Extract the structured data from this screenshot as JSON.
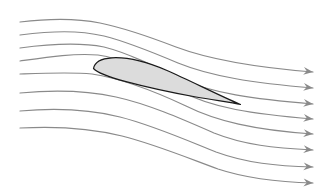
{
  "figure": {
    "width": 325,
    "height": 190,
    "background_color": "#ffffff"
  },
  "colors": {
    "background": "#ffffff",
    "streamline": "#8a8a8a",
    "arrowhead": "#8a8a8a",
    "airfoil_fill": "#dcdcdc",
    "airfoil_outline": "#1a1a1a"
  },
  "airfoil": {
    "name": "airfoil-cross-section",
    "fill": "#dcdcdc",
    "outline": "#1a1a1a",
    "outline_width": 1.2,
    "leading_edge": [
      93,
      67
    ],
    "trailing_edge": [
      240,
      104
    ],
    "chord_length": 150,
    "max_thickness": 24,
    "path": "M 93.5 68.5 C 94.5 62.5 101 58.5 112 57.8 C 126 57.0 146 61.5 167 70.5 C 190 80.5 218 95.0 240.5 104.5 C 232 102.5 214 100.2 196 97.0 C 172 92.6 146 87.0 126 81.6 C 108 76.8 97.5 73.0 93.5 68.5 Z"
  },
  "streamlines": {
    "count": 8,
    "stroke": "#8a8a8a",
    "stroke_width": 1.2,
    "start_x": 20,
    "end_x": 313,
    "arrow_size": 5,
    "paths": [
      {
        "id": "streamline-1",
        "label": "upper outer streamline",
        "start_y": 22,
        "end_y": 72,
        "d": "M 20 22 C 52 18 76 18 100 23 C 124 28 150 37 176 47 C 208 59 250 67 313 72"
      },
      {
        "id": "streamline-2",
        "label": "upper streamline 2",
        "start_y": 35,
        "end_y": 88,
        "d": "M 20 35 C 52 31 78 30 104 36 C 128 42 152 52 178 63 C 210 76 252 83 313 88"
      },
      {
        "id": "streamline-3",
        "label": "upper streamline 3",
        "start_y": 48,
        "end_y": 104,
        "d": "M 20 48 C 50 44 78 42 104 47 C 128 53 154 66 180 79 C 212 93 252 99 313 104"
      },
      {
        "id": "streamline-4",
        "label": "upper streamline 4 near suction surface",
        "start_y": 61,
        "end_y": 119,
        "d": "M 20 61 C 48 57 74 53 98 55 C 122 58 150 73 180 91 C 212 108 252 114 313 119"
      },
      {
        "id": "streamline-5",
        "label": "stagnation streamline along lower surface",
        "start_y": 74,
        "end_y": 134,
        "d": "M 20 74 C 48 73 72 72 92 74 C 118 78 152 90 186 106 C 216 121 254 130 313 134"
      },
      {
        "id": "streamline-6",
        "label": "lower streamline 6",
        "start_y": 93,
        "end_y": 150,
        "d": "M 20 93 C 52 90 84 90 116 97 C 148 104 182 119 214 133 C 244 145 274 148 313 150"
      },
      {
        "id": "streamline-7",
        "label": "lower streamline 7",
        "start_y": 111,
        "end_y": 167,
        "d": "M 20 111 C 54 108 88 109 120 117 C 152 125 186 140 216 152 C 246 163 276 166 313 167"
      },
      {
        "id": "streamline-8",
        "label": "lower outer streamline",
        "start_y": 128,
        "end_y": 183,
        "d": "M 20 128 C 56 126 90 128 122 136 C 154 144 188 158 218 169 C 248 179 278 182 313 183"
      }
    ],
    "arrowheads": [
      {
        "id": "arrowhead-1",
        "x": 313,
        "y": 72,
        "angle": 7
      },
      {
        "id": "arrowhead-2",
        "x": 313,
        "y": 88,
        "angle": 7
      },
      {
        "id": "arrowhead-3",
        "x": 313,
        "y": 104,
        "angle": 7
      },
      {
        "id": "arrowhead-4",
        "x": 313,
        "y": 119,
        "angle": 7
      },
      {
        "id": "arrowhead-5",
        "x": 313,
        "y": 134,
        "angle": 6
      },
      {
        "id": "arrowhead-6",
        "x": 313,
        "y": 150,
        "angle": 5
      },
      {
        "id": "arrowhead-7",
        "x": 313,
        "y": 167,
        "angle": 4
      },
      {
        "id": "arrowhead-8",
        "x": 313,
        "y": 183,
        "angle": 3
      }
    ]
  }
}
